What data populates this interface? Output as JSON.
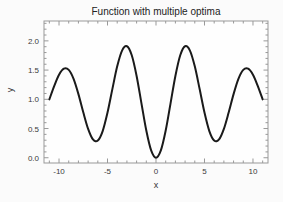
{
  "chart_data": {
    "type": "line",
    "title": "Function with multiple optima",
    "xlabel": "x",
    "ylabel": "y",
    "xlim": [
      -11.55,
      11.55
    ],
    "ylim": [
      -0.09,
      2.34
    ],
    "grid": false,
    "legend": null,
    "line_color": "#1a1a1a",
    "axis_color": "#999999",
    "tick_label_color": "#3a3a3a",
    "x_major_ticks": [
      {
        "v": -10,
        "label": "-10"
      },
      {
        "v": -5,
        "label": "-5"
      },
      {
        "v": 0,
        "label": "0"
      },
      {
        "v": 5,
        "label": "5"
      },
      {
        "v": 10,
        "label": "10"
      }
    ],
    "x_minor_step": 1,
    "y_major_ticks": [
      {
        "v": 0.0,
        "label": "0.0"
      },
      {
        "v": 0.5,
        "label": "0.5"
      },
      {
        "v": 1.0,
        "label": "1.0"
      },
      {
        "v": 1.5,
        "label": "1.5"
      },
      {
        "v": 2.0,
        "label": "2.0"
      }
    ],
    "y_minor_step": 0.1,
    "x": [
      -11,
      -10.5,
      -10,
      -9.5,
      -9,
      -8.5,
      -8,
      -7.5,
      -7,
      -6.5,
      -6,
      -5.5,
      -5,
      -4.5,
      -4,
      -3.5,
      -3,
      -2.5,
      -2,
      -1.5,
      -1,
      -0.5,
      0,
      0.5,
      1,
      1.5,
      2,
      2.5,
      3,
      3.5,
      4,
      4.5,
      5,
      5.5,
      6,
      6.5,
      7,
      7.5,
      8,
      8.5,
      9,
      9.5,
      10,
      10.5,
      11
    ],
    "y": [
      0.998,
      1.226,
      1.42,
      1.524,
      1.503,
      1.35,
      1.089,
      0.778,
      0.494,
      0.313,
      0.294,
      0.456,
      0.773,
      1.175,
      1.564,
      1.834,
      1.908,
      1.754,
      1.4,
      0.931,
      0.465,
      0.125,
      0.0,
      0.125,
      0.465,
      0.931,
      1.4,
      1.754,
      1.908,
      1.834,
      1.564,
      1.175,
      0.773,
      0.456,
      0.294,
      0.313,
      0.494,
      0.778,
      1.089,
      1.35,
      1.503,
      1.524,
      1.42,
      1.226,
      0.998
    ]
  }
}
